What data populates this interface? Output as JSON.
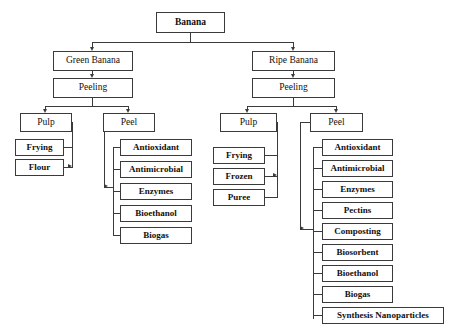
{
  "diagram": {
    "title": "Banana",
    "root": {
      "label": "Banana"
    },
    "branches": {
      "green": {
        "label": "Green Banana",
        "process": "Peeling",
        "pulp": {
          "label": "Pulp",
          "products": [
            "Frying",
            "Flour"
          ]
        },
        "peel": {
          "label": "Peel",
          "products": [
            "Antioxidant",
            "Antimicrobial",
            "Enzymes",
            "Bioethanol",
            "Biogas"
          ]
        }
      },
      "ripe": {
        "label": "Ripe Banana",
        "process": "Peeling",
        "pulp": {
          "label": "Pulp",
          "products": [
            "Frying",
            "Frozen",
            "Puree"
          ]
        },
        "peel": {
          "label": "Peel",
          "products": [
            "Antioxidant",
            "Antimicrobial",
            "Enzymes",
            "Pectins",
            "Composting",
            "Biosorbent",
            "Bioethanol",
            "Biogas",
            "Synthesis Nanoparticles"
          ]
        }
      }
    },
    "colors": {
      "background": "#ffffff",
      "box_border": "#3a3a3a",
      "text": "#111111",
      "connector": "#3a3a3a"
    }
  }
}
